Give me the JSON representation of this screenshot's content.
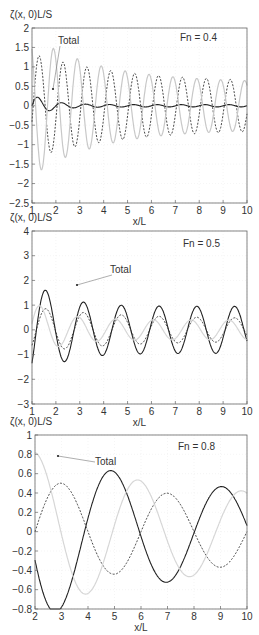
{
  "chart_data": [
    {
      "type": "line",
      "ylabel": "ζ(x, 0)L/S",
      "xlabel": "x/L",
      "annotation": "Fn = 0.4",
      "label": "Total",
      "box": {
        "x0": 32,
        "x1": 247,
        "y0": 28,
        "y1": 203
      },
      "xlim": [
        1,
        10
      ],
      "ylim": [
        -2.5,
        2
      ],
      "xticks": [
        1,
        2,
        3,
        4,
        5,
        6,
        7,
        8,
        9,
        10
      ],
      "yticks": [
        2,
        1.5,
        1,
        0.5,
        0,
        -0.5,
        -1,
        -1.5,
        -2,
        -2.5
      ],
      "ytick_labels": [
        "2",
        "1.5",
        "1",
        "0.5",
        "0",
        "−0.5",
        "−1",
        "−1.5",
        "−2",
        "−2.5"
      ],
      "label_pos": {
        "tx": 58,
        "ty": 44,
        "ax": 53,
        "ay": 89
      },
      "annot_pos": {
        "x": 180,
        "y": 41
      },
      "series": [
        {
          "name": "Total",
          "style": "solid",
          "color": "#222",
          "amp": 0.75,
          "decay": 0.45,
          "floor": 0.03,
          "period": 1.0,
          "phase": 0.0,
          "shift": 0.25
        },
        {
          "name": "Component A",
          "style": "dashed",
          "color": "#333",
          "amp": 1.5,
          "decay": 0.09,
          "floor": 0.6,
          "period": 1.0,
          "phase": 0.0,
          "shift": 0.3
        },
        {
          "name": "Component B",
          "style": "light",
          "color": "#c8c8c8",
          "amp": 2.1,
          "decay": 0.12,
          "floor": 0.6,
          "period": 1.0,
          "phase": 0.5,
          "shift": 0.4
        }
      ]
    },
    {
      "type": "line",
      "ylabel": "ζ(x, 0)L/S",
      "xlabel": "x/L",
      "annotation": "Fn = 0.5",
      "label": "Total",
      "box": {
        "x0": 32,
        "x1": 247,
        "y0": 231,
        "y1": 404
      },
      "xlim": [
        1,
        10
      ],
      "ylim": [
        -3,
        4
      ],
      "xticks": [
        1,
        2,
        3,
        4,
        5,
        6,
        7,
        8,
        9,
        10
      ],
      "yticks": [
        4,
        3,
        2,
        1,
        0,
        -1,
        -2,
        -3
      ],
      "ytick_labels": [
        "4",
        "3",
        "2",
        "1",
        "0",
        "−1",
        "−2",
        "−3"
      ],
      "label_pos": {
        "tx": 110,
        "ty": 273,
        "ax": 77,
        "ay": 285
      },
      "annot_pos": {
        "x": 183,
        "y": 247
      },
      "series": [
        {
          "name": "Total",
          "style": "solid",
          "color": "#222",
          "amp": 3.4,
          "decay": 0.28,
          "floor": 0.95,
          "period": 1.58,
          "phase": 0.0,
          "shift": 0.0
        },
        {
          "name": "Component A",
          "style": "dashed",
          "color": "#333",
          "amp": 1.1,
          "decay": 0.1,
          "floor": 0.45,
          "period": 1.58,
          "phase": 0.0,
          "shift": 0.0
        },
        {
          "name": "Component B",
          "style": "light",
          "color": "#d6d6d6",
          "amp": 2.3,
          "decay": 0.3,
          "floor": 0.4,
          "period": 1.58,
          "phase": 0.15,
          "shift": 0.0
        }
      ]
    },
    {
      "type": "line",
      "ylabel": "ζ(x, 0)L/S",
      "xlabel": "x/L",
      "annotation": "Fn = 0.8",
      "label": "Total",
      "box": {
        "x0": 35,
        "x1": 247,
        "y0": 435,
        "y1": 609
      },
      "xlim": [
        2,
        10
      ],
      "ylim": [
        -0.8,
        1
      ],
      "xticks": [
        2,
        3,
        4,
        5,
        6,
        7,
        8,
        9,
        10
      ],
      "yticks": [
        1,
        0.8,
        0.6,
        0.4,
        0.2,
        0,
        -0.2,
        -0.4,
        -0.6,
        -0.8
      ],
      "ytick_labels": [
        "1",
        "0.8",
        "0.6",
        "0.4",
        "0.2",
        "0",
        "−0.2",
        "−0.4",
        "−0.6",
        "−0.8"
      ],
      "label_pos": {
        "tx": 95,
        "ty": 465,
        "ax": 58,
        "ay": 456
      },
      "annot_pos": {
        "x": 178,
        "y": 450
      },
      "series": [
        {
          "name": "Total",
          "style": "solid",
          "color": "#222",
          "amp": 0.95,
          "decay": 0.1,
          "floor": 0.4,
          "period": 4.15,
          "phase": 0.3,
          "shift": 2.0
        },
        {
          "name": "Component A",
          "style": "dashed",
          "color": "#333",
          "amp": 0.54,
          "decay": 0.06,
          "floor": 0.3,
          "period": 4.0,
          "phase": -0.25,
          "shift": 2.0
        },
        {
          "name": "Component B",
          "style": "light",
          "color": "#d6d6d6",
          "amp": 0.82,
          "decay": 0.08,
          "floor": 0.35,
          "period": 3.9,
          "phase": 0.0,
          "shift": 2.0
        }
      ]
    }
  ]
}
